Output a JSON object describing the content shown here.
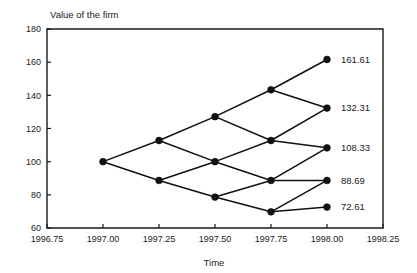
{
  "chart_data": {
    "type": "line",
    "title": "",
    "xlabel": "Time",
    "ylabel": "Value of the firm",
    "ylabel_position": "top-left-inside",
    "grid": false,
    "legend": "none",
    "xlim": [
      1996.75,
      1998.25
    ],
    "ylim": [
      60,
      180
    ],
    "xticks": [
      1996.75,
      1997.0,
      1997.25,
      1997.5,
      1997.75,
      1998.0,
      1998.25
    ],
    "xtick_labels": [
      "1996.75",
      "1997.00",
      "1997.25",
      "1997.50",
      "1997.75",
      "1998.00",
      "1998.25"
    ],
    "yticks": [
      60,
      80,
      100,
      120,
      140,
      160,
      180
    ],
    "ytick_labels": [
      "60",
      "80",
      "100",
      "120",
      "140",
      "160",
      "180"
    ],
    "marker": "filled-circle",
    "line_color": "#111111",
    "marker_color": "#111111",
    "structure": "binomial-lattice",
    "steps": 4,
    "up_factor": 1.1276,
    "down_factor": 0.8868,
    "initial_value": 100,
    "nodes": [
      {
        "x": 1997.0,
        "values": [
          100.0
        ]
      },
      {
        "x": 1997.25,
        "values": [
          112.76,
          88.68
        ]
      },
      {
        "x": 1997.5,
        "values": [
          127.14,
          100.0,
          78.64
        ]
      },
      {
        "x": 1997.75,
        "values": [
          143.35,
          112.76,
          88.68,
          69.74
        ]
      },
      {
        "x": 1998.0,
        "values": [
          161.61,
          132.31,
          108.33,
          88.69,
          72.61
        ]
      }
    ],
    "terminal_labels": [
      {
        "value": 161.61,
        "text": "161.61"
      },
      {
        "value": 132.31,
        "text": "132.31"
      },
      {
        "value": 108.33,
        "text": "108.33"
      },
      {
        "value": 88.69,
        "text": "88.69"
      },
      {
        "value": 72.61,
        "text": "72.61"
      }
    ]
  },
  "axis_titles": {
    "y": "Value of the firm",
    "x": "Time"
  }
}
